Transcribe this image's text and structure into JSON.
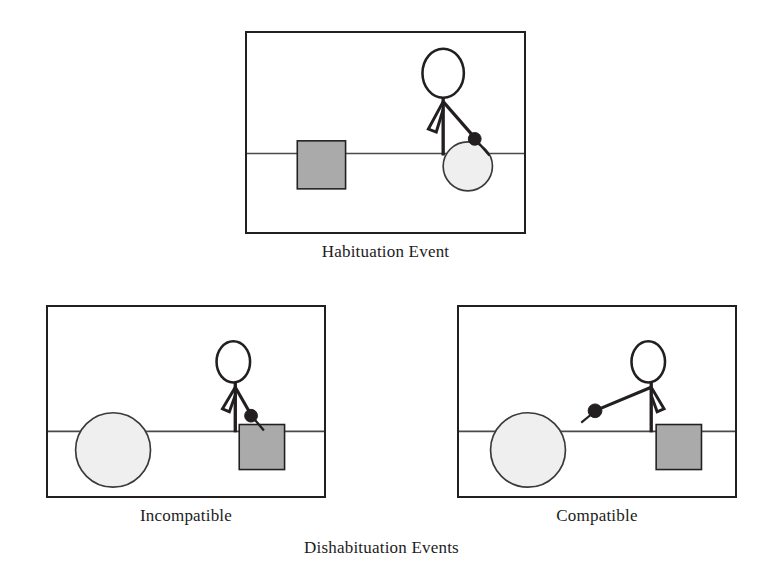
{
  "figure": {
    "title_caption": "Dishabituation Events",
    "panels": [
      {
        "id": "habituation",
        "caption": "Habituation Event",
        "table_surface": "horizontal line",
        "objects": [
          {
            "name": "gray-square",
            "position": "left",
            "color": "#aaaaaa"
          },
          {
            "name": "light-ball",
            "position": "right-under-hand",
            "color": "#efefef"
          },
          {
            "name": "stick-figure",
            "position": "right",
            "arm_direction": "down-right",
            "hand": "black-dot"
          }
        ]
      },
      {
        "id": "incompatible",
        "caption": "Incompatible",
        "table_surface": "horizontal line",
        "objects": [
          {
            "name": "light-ball",
            "position": "left",
            "color": "#efefef"
          },
          {
            "name": "gray-square",
            "position": "right-under-hand",
            "color": "#aaaaaa"
          },
          {
            "name": "stick-figure",
            "position": "right",
            "arm_direction": "down-right",
            "hand": "black-dot"
          }
        ]
      },
      {
        "id": "compatible",
        "caption": "Compatible",
        "table_surface": "horizontal line",
        "objects": [
          {
            "name": "light-ball",
            "position": "left",
            "color": "#efefef"
          },
          {
            "name": "gray-square",
            "position": "right",
            "color": "#aaaaaa"
          },
          {
            "name": "stick-figure",
            "position": "center-right",
            "arm_direction": "down-left",
            "hand": "black-dot"
          }
        ]
      }
    ],
    "colors": {
      "square_fill": "#aaaaaa",
      "square_stroke": "#231f20",
      "ball_fill": "#efefef",
      "ball_stroke": "#3a3a3a",
      "line": "#4a4a4a",
      "ink": "#231f20",
      "background": "#ffffff"
    }
  }
}
